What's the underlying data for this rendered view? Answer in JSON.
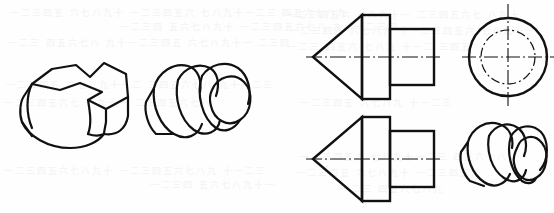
{
  "page": {
    "width": 554,
    "height": 213,
    "background_color": "#fefefe",
    "ink_color": "#111111",
    "ghost_text_color": "#f3f3f3",
    "kind": "scanned-textbook-page"
  },
  "ghost_text": {
    "note": "faint bleed-through characters from the reverse side of the scanned sheet; illegible",
    "lines": [
      {
        "text": "一二三四五 六七八九十 一二三四五六 七八九十一二三 四五六七八九",
        "x": 10,
        "y": 6
      },
      {
        "text": "一二三四 五六七八九十 一二三四五六七八 九十一二三四",
        "x": 120,
        "y": 20
      },
      {
        "text": "一二三 四五六七八 九十一二三四五 六七八九十一 二三四",
        "x": 8,
        "y": 36
      },
      {
        "text": "一二三四五六 七八九十一 二三四五六七 八九十",
        "x": 286,
        "y": 8
      },
      {
        "text": "一二三四五 六七八九 十一二三四五六 七八九十一",
        "x": 290,
        "y": 24
      },
      {
        "text": "一二三 四五六 七八九 十一二 三四五",
        "x": 288,
        "y": 40
      },
      {
        "text": "一二三四五 六七八九十一二 三四五六七八 九十一二三",
        "x": 6,
        "y": 78
      },
      {
        "text": "一二三四五六七 八九十一 二三四五六七八",
        "x": 4,
        "y": 96
      },
      {
        "text": "一二三四五 六七八九 十一二三",
        "x": 300,
        "y": 96
      },
      {
        "text": "一二三四五六七八九十 一二三四五六七八九 十一二三",
        "x": 4,
        "y": 164
      },
      {
        "text": "一二三四 五六七八九十一",
        "x": 150,
        "y": 178
      },
      {
        "text": "一二三四五六 七八九十一二三 四五六七八",
        "x": 300,
        "y": 150
      },
      {
        "text": "一二三四五 六七八九十 一二三四五六",
        "x": 296,
        "y": 166
      },
      {
        "text": "一二三 四五六七八九",
        "x": 340,
        "y": 182
      }
    ]
  },
  "figures": [
    {
      "id": "iso-faceted-block",
      "label": "isometric-pictorial-faceted-block",
      "position": {
        "x": 14,
        "y": 52
      },
      "size": {
        "width": 128,
        "height": 100
      },
      "description": "isometric pictorial of a rounded faceted block with a notched V-shaped top face"
    },
    {
      "id": "iso-stepped-cone-cylinder",
      "label": "isometric-pictorial-stepped-cone-cylinder",
      "position": {
        "x": 140,
        "y": 50
      },
      "size": {
        "width": 120,
        "height": 100
      },
      "description": "isometric pictorial of a stepped cone-and-cylinder revolved part"
    },
    {
      "id": "front-view-top",
      "label": "orthographic-front-view-upper",
      "position": {
        "x": 306,
        "y": 8
      },
      "size": {
        "width": 130,
        "height": 100
      },
      "description": "front view: cone point left, large cylinder body, smaller cylinder boss right, with dash-dot axis centreline"
    },
    {
      "id": "side-view-circle",
      "label": "orthographic-side-view-circular",
      "position": {
        "x": 462,
        "y": 2
      },
      "size": {
        "width": 92,
        "height": 108
      },
      "description": "left side view: solid outer circle with dash-dot inner circle and crosshair centre lines"
    },
    {
      "id": "front-view-bottom",
      "label": "orthographic-front-view-lower",
      "position": {
        "x": 306,
        "y": 112
      },
      "size": {
        "width": 130,
        "height": 96
      },
      "description": "repeat front view: cone point left, cylinder body, smaller boss right, with dash-dot axis centreline"
    },
    {
      "id": "iso-stepped-boss",
      "label": "isometric-pictorial-stepped-boss",
      "position": {
        "x": 456,
        "y": 116
      },
      "size": {
        "width": 92,
        "height": 86
      },
      "description": "isometric pictorial of the stepped cylindrical boss part"
    }
  ]
}
